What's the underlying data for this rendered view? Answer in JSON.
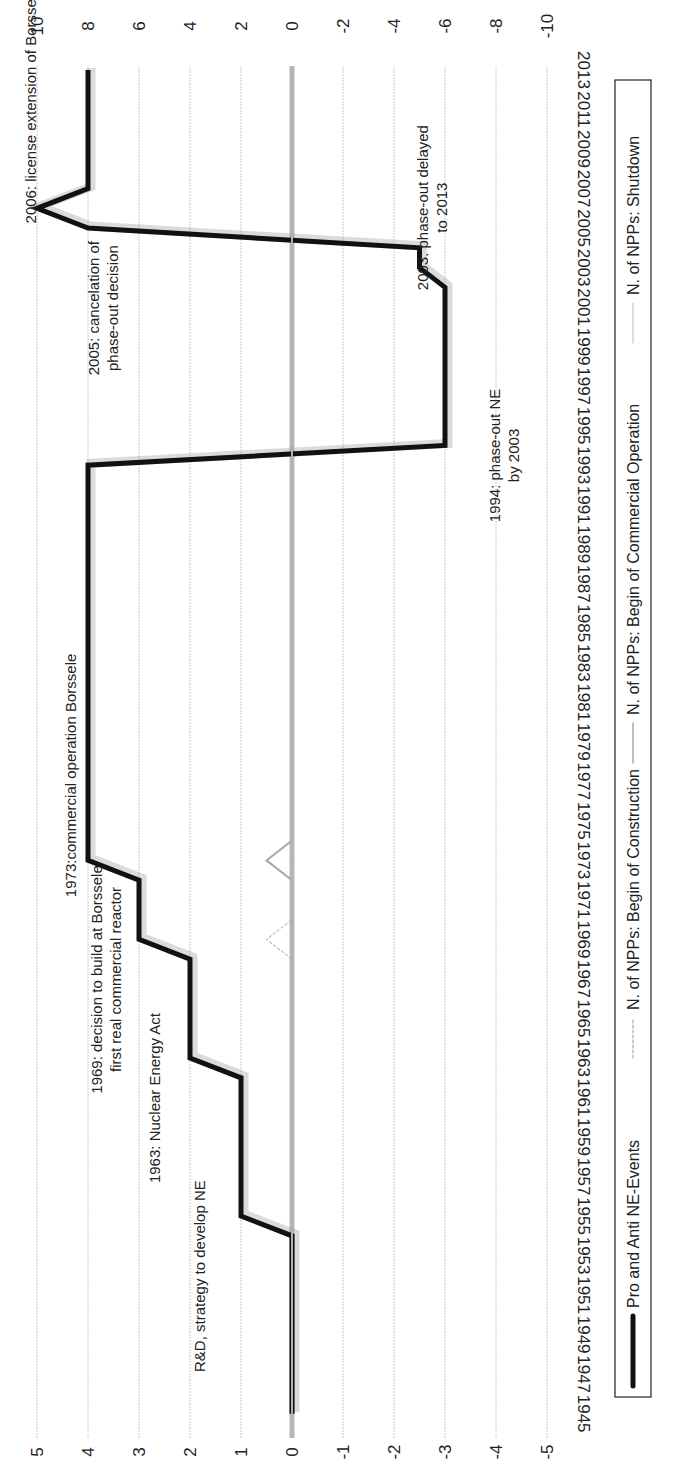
{
  "chart_data": {
    "type": "line",
    "title": "",
    "orientation_note": "figure rotated 90 degrees counter-clockwise",
    "xlabel": "",
    "ylabel_left": "",
    "ylabel_right": "",
    "x_ticks": [
      1945,
      1947,
      1949,
      1951,
      1953,
      1955,
      1957,
      1959,
      1961,
      1963,
      1965,
      1967,
      1969,
      1971,
      1973,
      1975,
      1977,
      1979,
      1981,
      1983,
      1985,
      1987,
      1989,
      1991,
      1993,
      1995,
      1997,
      1999,
      2001,
      2003,
      2005,
      2007,
      2009,
      2011,
      2013
    ],
    "y_left_ticks": [
      5,
      4,
      3,
      2,
      1,
      0,
      -1,
      -2,
      -3,
      -4,
      -5
    ],
    "y_left_tick_labels": [
      "5",
      "4",
      "3",
      "2",
      "1",
      "0",
      "-1",
      "-2",
      "-3",
      "-4",
      "-5"
    ],
    "y_right_ticks": [
      10,
      8,
      6,
      4,
      2,
      0,
      -2,
      -4,
      -6,
      -8,
      -10
    ],
    "y_right_tick_labels": [
      "10",
      "8",
      "6",
      "4",
      "2",
      "0",
      "-2",
      "-4",
      "-6",
      "-8",
      "-10"
    ],
    "ylim_left": [
      -5,
      5
    ],
    "ylim_right": [
      -10,
      10
    ],
    "grid": true,
    "legend_position": "bottom",
    "series": [
      {
        "name": "Pro and Anti NE-Events",
        "axis": "left",
        "style": "thick-black",
        "color": "#111111",
        "x": [
          1945,
          1954,
          1955,
          1962,
          1963,
          1968,
          1969,
          1972,
          1973,
          1993,
          1994,
          2002,
          2003,
          2004,
          2005,
          2006,
          2007,
          2013
        ],
        "values": [
          0,
          0,
          1,
          1,
          2,
          2,
          3,
          3,
          4,
          4,
          -3,
          -3,
          -2.5,
          -2.5,
          4,
          5,
          4,
          4
        ]
      },
      {
        "name": "N. of NPPs: Begin of Construction",
        "axis": "right",
        "style": "dotted-gray",
        "color": "#9a9a9a",
        "x": [
          1945,
          1968,
          1969,
          1970,
          2013
        ],
        "values": [
          0,
          0,
          1,
          0,
          0
        ]
      },
      {
        "name": "N. of NPPs: Begin of Commercial Operation",
        "axis": "right",
        "style": "solid-gray",
        "color": "#a8a8a8",
        "x": [
          1945,
          1972,
          1973,
          1974,
          2013
        ],
        "values": [
          0,
          0,
          1,
          0,
          0
        ]
      },
      {
        "name": "N. of NPPs: Shutdown",
        "axis": "right",
        "style": "thin-gray",
        "color": "#bbbbbb",
        "x": [
          1945,
          2013
        ],
        "values": [
          0,
          0
        ]
      }
    ],
    "annotations": [
      {
        "lines": [
          "R&D, strategy to develop NE"
        ],
        "year": 1955,
        "value": 1.2
      },
      {
        "lines": [
          "1963: Nuclear Energy Act"
        ],
        "year": 1963,
        "value": 2.2
      },
      {
        "lines": [
          "1969: decision to build at Borssele",
          "first real commercial reactor"
        ],
        "year": 1969,
        "value": 3.2
      },
      {
        "lines": [
          "1973:commercial operation Borssele"
        ],
        "year": 1973,
        "value": 4.2
      },
      {
        "lines": [
          "1994: phase-out NE",
          "by 2003"
        ],
        "year": 1994,
        "value": -3.2
      },
      {
        "lines": [
          "2003: phase-out delayed",
          "to 2013"
        ],
        "year": 2003,
        "value": -2.7
      },
      {
        "lines": [
          "2005: cancelation of",
          "phase-out decision"
        ],
        "year": 2005,
        "value": 3.8
      },
      {
        "lines": [
          "2006: license extension of Borssele to 2033"
        ],
        "year": 2006,
        "value": 5.0
      }
    ]
  },
  "legend": {
    "items": [
      {
        "label": "Pro and Anti NE-Events",
        "swatch": "thick-black"
      },
      {
        "label": "N. of NPPs: Begin of Construction",
        "swatch": "dotted-gray"
      },
      {
        "label": "N. of NPPs: Begin of Commercial Operation",
        "swatch": "solid-gray"
      },
      {
        "label": "N. of NPPs: Shutdown",
        "swatch": "thin-gray"
      }
    ]
  },
  "colors": {
    "gridline": "#c8c8c8",
    "zero_line": "#b8b8b8",
    "events_line": "#111111",
    "text": "#222222"
  }
}
